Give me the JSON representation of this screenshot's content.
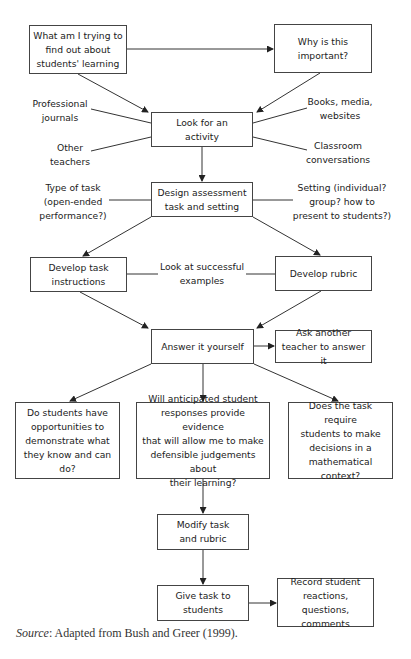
{
  "nodes": {
    "question": "What am I trying to\nfind out about\nstudents' learning",
    "why": "Why is this\nimportant?",
    "look": "Look for an\nactivity",
    "design": "Design assessment\ntask and setting",
    "dev_instructions": "Develop task\ninstructions",
    "dev_rubric": "Develop rubric",
    "answer": "Answer it yourself",
    "ask_another": "Ask another\nteacher to answer it",
    "q_opportunities": "Do students have\nopportunities to\ndemonstrate what\nthey know and can\ndo?",
    "q_evidence": "Will anticipated student\nresponses provide evidence\nthat will allow me to make\ndefensible judgements about\ntheir learning?",
    "q_context": "Does the task require\nstudents to make\ndecisions in a\nmathematical\ncontext?",
    "modify": "Modify task\nand rubric",
    "give": "Give task to\nstudents",
    "record": "Record student\nreactions, questions,\ncomments"
  },
  "labels": {
    "journals": "Professional\njournals",
    "other_teachers": "Other\nteachers",
    "books": "Books, media,\nwebsites",
    "classroom": "Classroom\nconversations",
    "type_of_task": "Type of task\n(open-ended\nperformance?)",
    "setting": "Setting (individual?\ngroup? how to\npresent to students?)",
    "examples": "Look at successful\nexamples"
  },
  "source": {
    "prefix": "Source",
    "text": ": Adapted from Bush and Greer (1999)."
  },
  "colors": {
    "line": "#333333",
    "border": "#444444"
  }
}
